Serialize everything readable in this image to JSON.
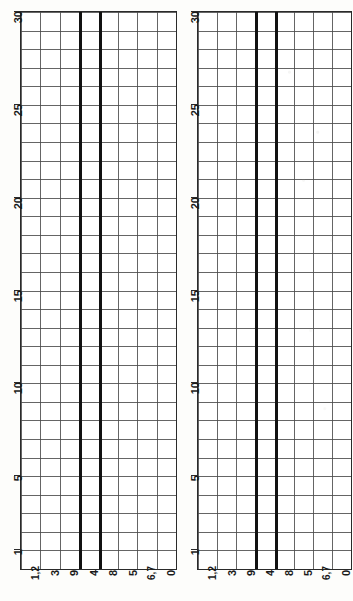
{
  "document": {
    "kind": "scanned-figure",
    "orientation": "rotated-90",
    "panel_count": 2
  },
  "chart_data": [
    {
      "type": "bar",
      "title": "",
      "subtitle": "",
      "xlabel": "",
      "ylabel": "",
      "grid": true,
      "legend": null,
      "orientation": "vertical-grid-sideways",
      "categories": [
        "1,2",
        "3",
        "9",
        "4",
        "8",
        "5",
        "6,7",
        "0"
      ],
      "values": [
        30,
        30,
        30,
        30,
        30,
        30,
        30,
        30
      ],
      "ylim": [
        0,
        30
      ],
      "yticks": [
        1,
        5,
        10,
        15,
        20,
        25,
        30
      ],
      "ytick_labels": [
        "1",
        "5",
        "10",
        "15",
        "20",
        "25",
        "30"
      ],
      "emphasized_dividers": [
        3,
        4
      ],
      "row_count": 30,
      "column_count": 8,
      "annotations": []
    },
    {
      "type": "bar",
      "title": "",
      "subtitle": "",
      "xlabel": "",
      "ylabel": "",
      "grid": true,
      "legend": null,
      "orientation": "vertical-grid-sideways",
      "categories": [
        "1,2",
        "3",
        "9",
        "4",
        "8",
        "5",
        "6,7",
        "0"
      ],
      "values": [
        30,
        30,
        30,
        30,
        30,
        30,
        30,
        30
      ],
      "ylim": [
        0,
        30
      ],
      "yticks": [
        1,
        5,
        10,
        15,
        20,
        25,
        30
      ],
      "ytick_labels": [
        "1",
        "5",
        "10",
        "15",
        "20",
        "25",
        "30"
      ],
      "emphasized_dividers": [
        3,
        4
      ],
      "row_count": 30,
      "column_count": 8,
      "annotations": []
    }
  ],
  "colors": {
    "paper": "#fdfdfb",
    "plot_background": "#ffffff",
    "grid_line": "#4a4a4a",
    "bold_line": "#111111",
    "frame": "#2a2a2a",
    "label_text": "#1a1a1a"
  }
}
